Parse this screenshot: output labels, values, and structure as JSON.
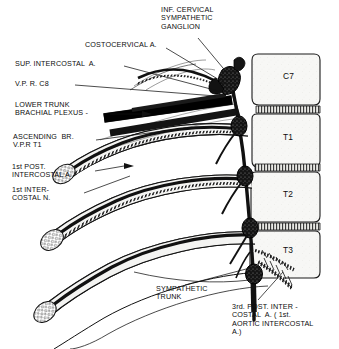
{
  "figure": {
    "title_visible": false,
    "type": "anatomical-line-drawing",
    "background_color": "#ffffff",
    "ink_color": "#111111"
  },
  "labels": {
    "inf_cervical_ganglion": "INF. CERVICAL\nSYMPATHETIC\nGANGLION",
    "costocervical": "COSTOCERVICAL A.",
    "sup_intercostal": "SUP. INTERCOSTAL  A.",
    "vpr_c8": "V.P. R. C8",
    "lower_trunk": "LOWER TRUNK\nBRACHIAL PLEXUS -",
    "ascending_br": "ASCENDING  BR.\nV.P.R T1",
    "first_post_intercostal": "1st POST.\nINTERCOSTAL A.",
    "first_intercostal_n": "1st INTER-\nCOSTAL N.",
    "sympathetic_trunk": "SYMPATHETIC\nTRUNK",
    "third_post_intercostal": "3rd. POST. INTER -\nCOSTAL  A. ( 1st.\nAORTIC INTERCOSTAL\nA.)"
  },
  "vertebrae": [
    {
      "name": "C7",
      "label": "C7"
    },
    {
      "name": "T1",
      "label": "T1"
    },
    {
      "name": "T2",
      "label": "T2"
    },
    {
      "name": "T3",
      "label": "T3"
    }
  ],
  "structures": {
    "sympathetic_trunk_ganglia_count": 5,
    "ribs_count": 4,
    "leader_lines_count": 10
  }
}
